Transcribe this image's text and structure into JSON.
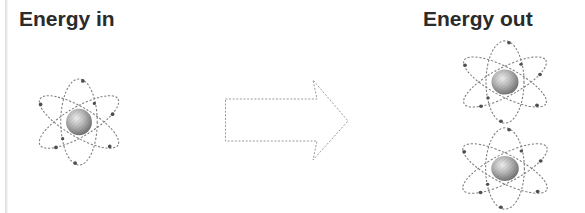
{
  "diagram": {
    "energy_in": {
      "label": "Energy in",
      "atom_count": 1
    },
    "energy_out": {
      "label": "Energy out",
      "atom_count": 2
    },
    "arrow": {
      "icon": "block-arrow-right-icon",
      "direction": "right"
    },
    "icons": {
      "atom": "atom-icon"
    },
    "colors": {
      "background": "#ffffff",
      "title_text": "#2b2b2b",
      "arrow_outline": "#9b9b9b",
      "orbit_stroke": "#7d7d7d",
      "electron_fill": "#4f4f4f",
      "nucleus_highlight": "#efefef",
      "nucleus_shadow": "#6b6b6b"
    }
  }
}
